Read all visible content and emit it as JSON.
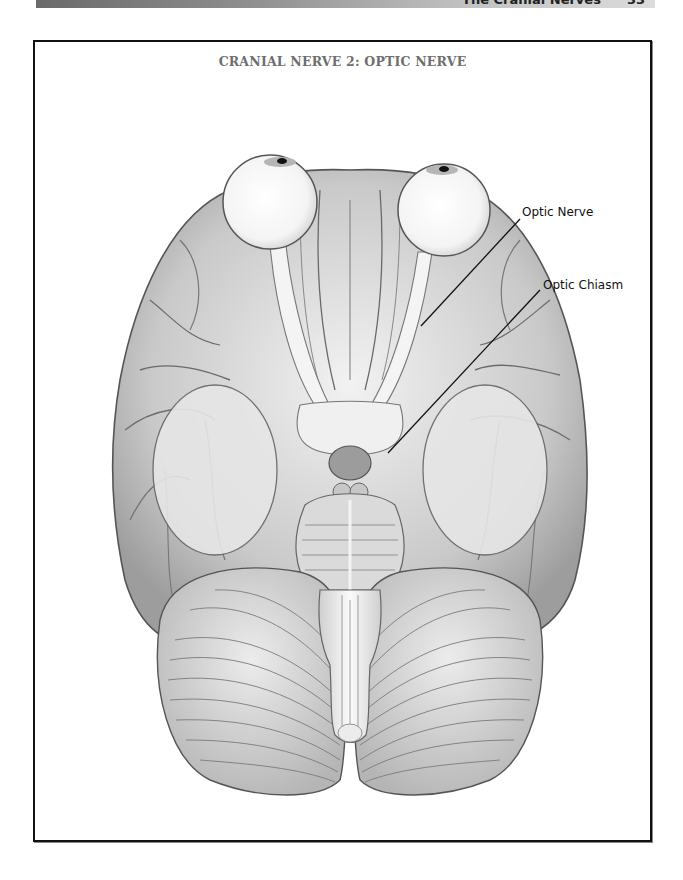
{
  "running_header": {
    "section": "The Cranial Nerves",
    "page_number": "33"
  },
  "figure": {
    "title": "CRANIAL NERVE 2: OPTIC NERVE",
    "labels": [
      {
        "text": "Optic Nerve",
        "x": 522,
        "y": 205,
        "line": {
          "x1": 520,
          "y1": 219,
          "x2": 421,
          "y2": 326
        }
      },
      {
        "text": "Optic Chiasm",
        "x": 543,
        "y": 278,
        "line": {
          "x1": 540,
          "y1": 290,
          "x2": 388,
          "y2": 453
        }
      }
    ]
  },
  "colors": {
    "frame_border": "#111111",
    "title_gray": "#6e6e6e",
    "pencil_dark": "#555555",
    "pencil_mid": "#9a9a9a",
    "pencil_light": "#d8d8d8"
  }
}
